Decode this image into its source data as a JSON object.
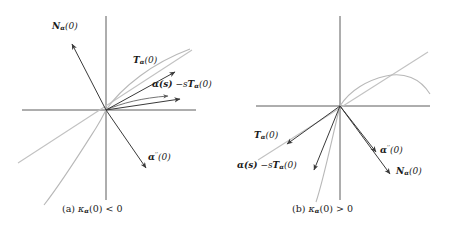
{
  "figure": {
    "type": "diagram",
    "background_color": "#ffffff",
    "axis_color": "#4a4a4a",
    "curve_color": "#b8b8b8",
    "vector_color": "#3a3a3a"
  },
  "panels": [
    {
      "id": "a",
      "caption_prefix": "(a)",
      "caption_expr_kappa": "κ",
      "caption_expr_sub": "α",
      "caption_expr_rest": "(0) < 0",
      "caption_full": "(a) κα(0) < 0",
      "origin": {
        "x": 106,
        "y": 110
      },
      "labels": {
        "normal": {
          "base": "N",
          "sub": "α",
          "arg": "(0)",
          "text": "Nα(0)"
        },
        "tangent": {
          "base": "T",
          "sub": "α",
          "arg": "(0)",
          "text": "Tα(0)"
        },
        "displacement": {
          "text": "α(s) − sTα(0)",
          "lead": "α(s)",
          "minus": "−",
          "trail_s": "s",
          "trail_T": "T",
          "trail_sub": "α",
          "trail_arg": "(0)"
        },
        "accel": {
          "base": "α",
          "primes": "′′",
          "arg": "(0)",
          "text": "α″(0)"
        }
      },
      "vectors": [
        {
          "name": "N_alpha(0)",
          "angle_deg": 118,
          "direction": "upper-left"
        },
        {
          "name": "T_alpha(0)",
          "angle_deg": 28,
          "direction": "upper-right"
        },
        {
          "name": "alpha(s) - sT_alpha(0)",
          "angle_deg": 6,
          "direction": "right"
        },
        {
          "name": "alpha''(0)",
          "angle_deg": -62,
          "direction": "lower-right"
        }
      ]
    },
    {
      "id": "b",
      "caption_prefix": "(b)",
      "caption_expr_kappa": "κ",
      "caption_expr_sub": "α",
      "caption_expr_rest": "(0) > 0",
      "caption_full": "(b) κα(0) > 0",
      "origin": {
        "x": 106,
        "y": 106
      },
      "labels": {
        "normal": {
          "base": "N",
          "sub": "α",
          "arg": "(0)",
          "text": "Nα(0)"
        },
        "tangent": {
          "base": "T",
          "sub": "α",
          "arg": "(0)",
          "text": "Tα(0)"
        },
        "displacement": {
          "text": "α(s) − sTα(0)",
          "lead": "α(s)",
          "minus": "−",
          "trail_s": "s",
          "trail_T": "T",
          "trail_sub": "α",
          "trail_arg": "(0)"
        },
        "accel": {
          "base": "α",
          "primes": "′′",
          "arg": "(0)",
          "text": "α″(0)"
        }
      },
      "vectors": [
        {
          "name": "T_alpha(0)",
          "angle_deg": 208,
          "direction": "lower-left"
        },
        {
          "name": "alpha(s) - sT_alpha(0)",
          "angle_deg": 236,
          "direction": "lower-left-steep"
        },
        {
          "name": "alpha''(0)",
          "angle_deg": -53,
          "direction": "lower-right"
        },
        {
          "name": "N_alpha(0)",
          "angle_deg": -62,
          "direction": "lower-right-far"
        }
      ]
    }
  ]
}
